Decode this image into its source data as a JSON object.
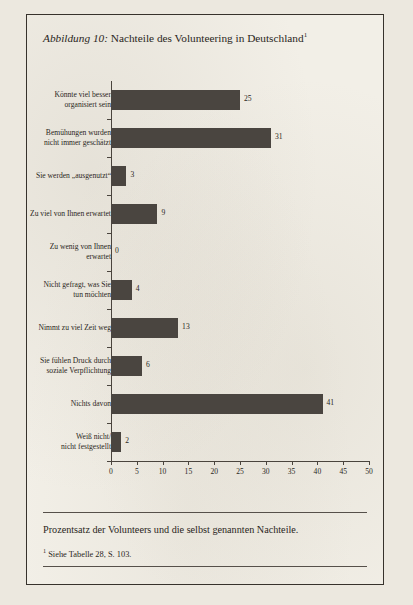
{
  "figure": {
    "label": "Abbildung 10:",
    "title": "Nachteile des Volunteering in Deutschland",
    "title_footnote_marker": "1"
  },
  "caption": "Prozentsatz der Volunteers und die selbst genannten Nachteile.",
  "footnote": {
    "marker": "1",
    "text": "Siehe Tabelle 28, S. 103."
  },
  "chart_data": {
    "type": "bar",
    "orientation": "horizontal",
    "title": "Nachteile des Volunteering in Deutschland",
    "xlabel": "",
    "ylabel": "",
    "xlim": [
      0,
      50
    ],
    "xticks": [
      "0",
      "5",
      "10",
      "15",
      "20",
      "25",
      "30",
      "35",
      "40",
      "45",
      "50"
    ],
    "grid": false,
    "legend": false,
    "bar_color": "#4a4540",
    "categories": [
      "Könnte viel besser organisiert sein",
      "Bemühungen wurden nicht immer geschätzt",
      "Sie werden „ausgenutzt“",
      "Zu viel von Ihnen erwartet",
      "Zu wenig von Ihnen erwartet",
      "Nicht gefragt, was Sie tun möchten",
      "Nimmt zu viel Zeit weg",
      "Sie fühlen Druck durch soziale Verpflichtung",
      "Nichts davon",
      "Weiß nicht/ nicht festgestellt"
    ],
    "category_lines": [
      [
        "Könnte viel besser",
        "organisiert sein"
      ],
      [
        "Bemühungen wurden",
        "nicht immer geschätzt"
      ],
      [
        "Sie werden „ausgenutzt“"
      ],
      [
        "Zu viel von Ihnen erwartet"
      ],
      [
        "Zu wenig von Ihnen",
        "erwartet"
      ],
      [
        "Nicht gefragt, was Sie",
        "tun möchten"
      ],
      [
        "Nimmt zu viel Zeit weg"
      ],
      [
        "Sie fühlen Druck durch",
        "soziale Verpflichtung"
      ],
      [
        "Nichts davon"
      ],
      [
        "Weiß nicht/",
        "nicht festgestellt"
      ]
    ],
    "values": [
      25,
      31,
      3,
      9,
      0,
      4,
      13,
      6,
      41,
      2
    ],
    "value_labels": [
      "25",
      "31",
      "3",
      "9",
      "0",
      "4",
      "13",
      "6",
      "41",
      "2"
    ]
  }
}
